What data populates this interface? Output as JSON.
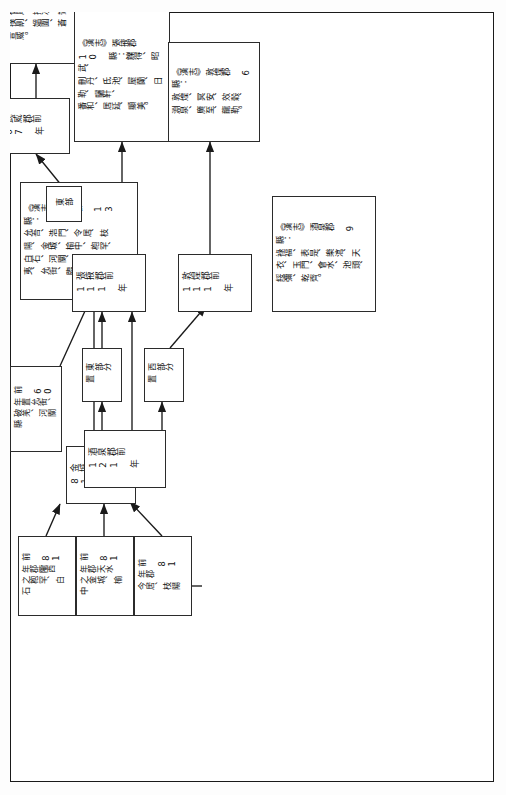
{
  "document": {
    "type": "flowchart",
    "orientation": "rotated-90-ccw",
    "language": "zh-Hant",
    "page_border_color": "#1a1a1a",
    "box_border_color": "#2b2b2b",
    "line_color": "#1a1a1a",
    "background": "#ffffff"
  },
  "nodes": {
    "jiuquan_121": "酒泉郡前 121 年",
    "zhangye_111": "張掖郡前 111 年",
    "dunhuang_111": "敦煌郡前 111 年",
    "jincheng_81": "金城郡前 81 年",
    "wuwei_67": "武威郡前 67 年",
    "src_81_longxi": "前 81 年郡隴西\n之枹罕、白石",
    "src_81_tianshui": "前 81 年郡天水\n之金城、榆中",
    "src_81_jun": "前 81 年郡\n今居、枝陽",
    "src_60_yunjie": "前 60 年置允街、\n破羌、河關縣"
  },
  "edge_labels": {
    "east_split": "東部分置",
    "west_split": "西部分置",
    "east": "東部"
  },
  "lists": {
    "jincheng": "《漢志》金城郡 13 縣：\n允吾、浩門、令居、枝\n陽、金城、榆中、枹罕、\n白石、河關、破羌、安\n夷、允街、臨羌。",
    "wuwei": "《漢志》武威郡 10\n縣：姑臧、張掖、武\n威、休屠、揟次、鸞\n鳥、撲劓、媼圍、蒼\n松、宣威。",
    "zhangye": "《漢志》張掖郡 10 縣：觻得、昭武、\n刪丹、氐池、屋蘭、日勒、驪靬、\n番和、居延、顯美。",
    "jiuquan": "《漢志》酒泉郡 9 縣：\n祿福、表是、樂涫、天\n衣、玉門、會水、池頭、\n綏彌、乾齊。",
    "dunhuang": "《漢志》敦煌郡 6 縣：\n敦煌、冥安、效穀、\n淵泉、廣至、龍勒。"
  }
}
